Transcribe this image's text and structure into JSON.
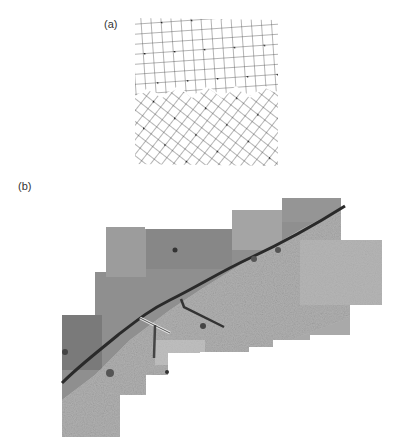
{
  "figure": {
    "panel_a": {
      "label": "(a)",
      "description": "Schematic of a grain boundary between two square-lattice grains with coincidence-site dots",
      "upper_grain": {
        "rotation_deg": -4,
        "cell_px": 10,
        "dot_every": 3
      },
      "lower_grain": {
        "rotation_deg": 38,
        "cell_px": 10,
        "dot_every": 3
      },
      "line_color": "#333333",
      "dot_color": "#111111"
    },
    "panel_b": {
      "label": "(b)",
      "description": "Photomicrograph mosaic of a bicrystal showing a curved grain boundary",
      "boundary_color": "#2a2a2a",
      "tile_colors": [
        "#8c8c8c",
        "#9a9a9a",
        "#a7a7a7",
        "#b3b3b3",
        "#7a7a7a",
        "#bdbdbd"
      ]
    }
  }
}
